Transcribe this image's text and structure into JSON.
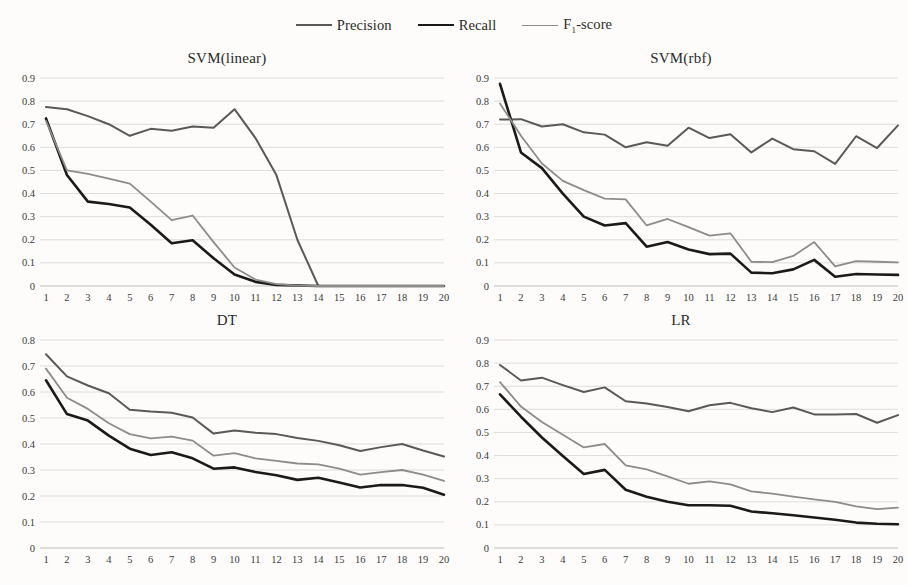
{
  "legend": {
    "items": [
      {
        "label": "Precision",
        "key": "precision",
        "color": "#595959",
        "width": 2.0
      },
      {
        "label": "Recall",
        "key": "recall",
        "color": "#1a1a1a",
        "width": 2.6
      },
      {
        "label": "F1-score",
        "key": "f1",
        "color": "#8c8c8c",
        "width": 1.8
      }
    ]
  },
  "chart_data": [
    {
      "id": "svm-linear",
      "type": "line",
      "title": "SVM(linear)",
      "xlabel": "",
      "ylabel": "",
      "x": [
        1,
        2,
        3,
        4,
        5,
        6,
        7,
        8,
        9,
        10,
        11,
        12,
        13,
        14,
        15,
        16,
        17,
        18,
        19,
        20
      ],
      "xtick_labels": [
        "1",
        "2",
        "3",
        "4",
        "5",
        "6",
        "7",
        "8",
        "9",
        "10",
        "11",
        "12",
        "13",
        "14",
        "15",
        "16",
        "17",
        "18",
        "19",
        "20"
      ],
      "ytick_labels": [
        "0",
        "0.1",
        "0.2",
        "0.3",
        "0.4",
        "0.5",
        "0.6",
        "0.7",
        "0.8",
        "0.9"
      ],
      "ylim": [
        0,
        0.9
      ],
      "ytick_step": 0.1,
      "grid": true,
      "legend_position": "figure-top-center",
      "series": [
        {
          "name": "Precision",
          "color": "#595959",
          "width": 2.0,
          "values": [
            0.775,
            0.765,
            0.735,
            0.7,
            0.65,
            0.68,
            0.672,
            0.69,
            0.685,
            0.765,
            0.64,
            0.48,
            0.2,
            0.0,
            0.0,
            0.0,
            0.0,
            0.0,
            0.0,
            0.0
          ]
        },
        {
          "name": "Recall",
          "color": "#1a1a1a",
          "width": 2.6,
          "values": [
            0.725,
            0.48,
            0.365,
            0.355,
            0.34,
            0.265,
            0.185,
            0.198,
            0.12,
            0.05,
            0.018,
            0.005,
            0.002,
            0.0,
            0.0,
            0.0,
            0.0,
            0.0,
            0.0,
            0.0
          ]
        },
        {
          "name": "F1-score",
          "color": "#8c8c8c",
          "width": 1.8,
          "values": [
            0.715,
            0.5,
            0.485,
            0.465,
            0.443,
            0.365,
            0.285,
            0.305,
            0.19,
            0.08,
            0.028,
            0.008,
            0.002,
            0.0,
            0.0,
            0.0,
            0.0,
            0.0,
            0.0,
            0.0
          ]
        }
      ]
    },
    {
      "id": "svm-rbf",
      "type": "line",
      "title": "SVM(rbf)",
      "xlabel": "",
      "ylabel": "",
      "x": [
        1,
        2,
        3,
        4,
        5,
        6,
        7,
        8,
        9,
        10,
        11,
        12,
        13,
        14,
        15,
        16,
        17,
        18,
        19,
        20
      ],
      "xtick_labels": [
        "1",
        "2",
        "3",
        "4",
        "5",
        "6",
        "7",
        "8",
        "9",
        "10",
        "11",
        "12",
        "13",
        "14",
        "15",
        "16",
        "17",
        "18",
        "19",
        "20"
      ],
      "ytick_labels": [
        "0",
        "0.1",
        "0.2",
        "0.3",
        "0.4",
        "0.5",
        "0.6",
        "0.7",
        "0.8",
        "0.9"
      ],
      "ylim": [
        0,
        0.9
      ],
      "ytick_step": 0.1,
      "grid": true,
      "legend_position": "figure-top-center",
      "series": [
        {
          "name": "Precision",
          "color": "#595959",
          "width": 2.0,
          "values": [
            0.72,
            0.722,
            0.69,
            0.7,
            0.665,
            0.655,
            0.6,
            0.622,
            0.607,
            0.685,
            0.64,
            0.657,
            0.578,
            0.638,
            0.592,
            0.583,
            0.528,
            0.648,
            0.597,
            0.695
          ]
        },
        {
          "name": "Recall",
          "color": "#1a1a1a",
          "width": 2.6,
          "values": [
            0.875,
            0.578,
            0.51,
            0.4,
            0.3,
            0.262,
            0.272,
            0.17,
            0.19,
            0.158,
            0.138,
            0.14,
            0.058,
            0.055,
            0.072,
            0.113,
            0.04,
            0.052,
            0.05,
            0.048
          ]
        },
        {
          "name": "F1-score",
          "color": "#8c8c8c",
          "width": 1.8,
          "values": [
            0.79,
            0.65,
            0.53,
            0.455,
            0.415,
            0.378,
            0.375,
            0.262,
            0.29,
            0.255,
            0.218,
            0.228,
            0.105,
            0.103,
            0.13,
            0.19,
            0.085,
            0.108,
            0.105,
            0.102
          ]
        }
      ]
    },
    {
      "id": "dt",
      "type": "line",
      "title": "DT",
      "xlabel": "",
      "ylabel": "",
      "x": [
        1,
        2,
        3,
        4,
        5,
        6,
        7,
        8,
        9,
        10,
        11,
        12,
        13,
        14,
        15,
        16,
        17,
        18,
        19,
        20
      ],
      "xtick_labels": [
        "1",
        "2",
        "3",
        "4",
        "5",
        "6",
        "7",
        "8",
        "9",
        "10",
        "11",
        "12",
        "13",
        "14",
        "15",
        "16",
        "17",
        "18",
        "19",
        "20"
      ],
      "ytick_labels": [
        "0",
        "0.1",
        "0.2",
        "0.3",
        "0.4",
        "0.5",
        "0.6",
        "0.7",
        "0.8"
      ],
      "ylim": [
        0,
        0.8
      ],
      "ytick_step": 0.1,
      "grid": true,
      "legend_position": "figure-top-center",
      "series": [
        {
          "name": "Precision",
          "color": "#595959",
          "width": 2.0,
          "values": [
            0.745,
            0.66,
            0.625,
            0.595,
            0.532,
            0.525,
            0.52,
            0.502,
            0.44,
            0.452,
            0.443,
            0.438,
            0.423,
            0.412,
            0.395,
            0.373,
            0.388,
            0.4,
            0.375,
            0.352
          ]
        },
        {
          "name": "Recall",
          "color": "#1a1a1a",
          "width": 2.6,
          "values": [
            0.645,
            0.515,
            0.49,
            0.432,
            0.382,
            0.358,
            0.368,
            0.345,
            0.305,
            0.31,
            0.292,
            0.28,
            0.262,
            0.27,
            0.252,
            0.233,
            0.242,
            0.242,
            0.232,
            0.205
          ]
        },
        {
          "name": "F1-score",
          "color": "#8c8c8c",
          "width": 1.8,
          "values": [
            0.69,
            0.578,
            0.535,
            0.48,
            0.438,
            0.422,
            0.428,
            0.413,
            0.355,
            0.365,
            0.345,
            0.335,
            0.325,
            0.322,
            0.305,
            0.282,
            0.292,
            0.3,
            0.282,
            0.258
          ]
        }
      ]
    },
    {
      "id": "lr",
      "type": "line",
      "title": "LR",
      "xlabel": "",
      "ylabel": "",
      "x": [
        1,
        2,
        3,
        4,
        5,
        6,
        7,
        8,
        9,
        10,
        11,
        12,
        13,
        14,
        15,
        16,
        17,
        18,
        19,
        20
      ],
      "xtick_labels": [
        "1",
        "2",
        "3",
        "4",
        "5",
        "6",
        "7",
        "8",
        "9",
        "10",
        "11",
        "12",
        "13",
        "14",
        "15",
        "16",
        "17",
        "18",
        "19",
        "20"
      ],
      "ytick_labels": [
        "0",
        "0.1",
        "0.2",
        "0.3",
        "0.4",
        "0.5",
        "0.6",
        "0.7",
        "0.8",
        "0.9"
      ],
      "ylim": [
        0,
        0.9
      ],
      "ytick_step": 0.1,
      "grid": true,
      "legend_position": "figure-top-center",
      "series": [
        {
          "name": "Precision",
          "color": "#595959",
          "width": 2.0,
          "values": [
            0.792,
            0.725,
            0.737,
            0.705,
            0.675,
            0.695,
            0.635,
            0.625,
            0.61,
            0.592,
            0.618,
            0.628,
            0.605,
            0.588,
            0.608,
            0.578,
            0.578,
            0.58,
            0.542,
            0.575
          ]
        },
        {
          "name": "Recall",
          "color": "#1a1a1a",
          "width": 2.6,
          "values": [
            0.665,
            0.568,
            0.478,
            0.398,
            0.32,
            0.338,
            0.252,
            0.222,
            0.2,
            0.185,
            0.185,
            0.183,
            0.158,
            0.15,
            0.142,
            0.132,
            0.122,
            0.11,
            0.105,
            0.103
          ]
        },
        {
          "name": "F1-score",
          "color": "#8c8c8c",
          "width": 1.8,
          "values": [
            0.718,
            0.612,
            0.545,
            0.49,
            0.435,
            0.45,
            0.358,
            0.34,
            0.31,
            0.278,
            0.288,
            0.275,
            0.245,
            0.235,
            0.222,
            0.21,
            0.2,
            0.18,
            0.168,
            0.175
          ]
        }
      ]
    }
  ]
}
